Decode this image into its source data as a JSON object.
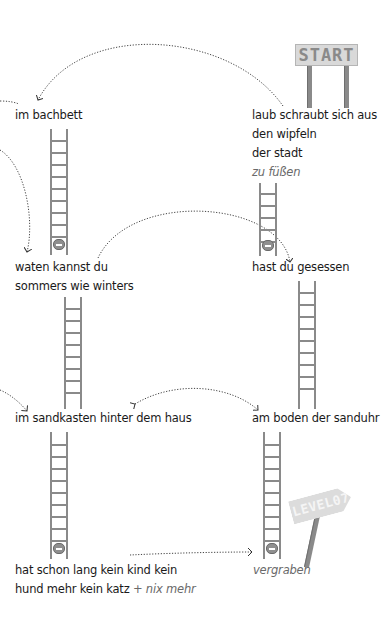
{
  "signs": {
    "start": "START",
    "level": "LEVEL07"
  },
  "stations": {
    "start": {
      "lines": [
        "laub schraubt sich aus",
        "den wipfeln",
        "der stadt"
      ],
      "italic": "zu füßen"
    },
    "bachbett": {
      "label": "im bachbett"
    },
    "waten": {
      "lines": [
        "waten kannst du",
        "sommers wie winters"
      ]
    },
    "gesessen": {
      "label": "hast du gesessen"
    },
    "sandkasten": {
      "label": "im sandkasten hinter dem haus"
    },
    "sanduhr": {
      "label": "am boden der sanduhr"
    },
    "kind": {
      "line1": "hat schon lang kein kind kein",
      "line2": "hund mehr kein katz",
      "suffix": "+ nix mehr"
    },
    "vergraben": {
      "label": "vergraben"
    }
  },
  "colors": {
    "ink": "#1a1a1a",
    "ladder": "#8a8a8a",
    "sign": "#d9d9d9",
    "italic": "#6a6a6a"
  }
}
